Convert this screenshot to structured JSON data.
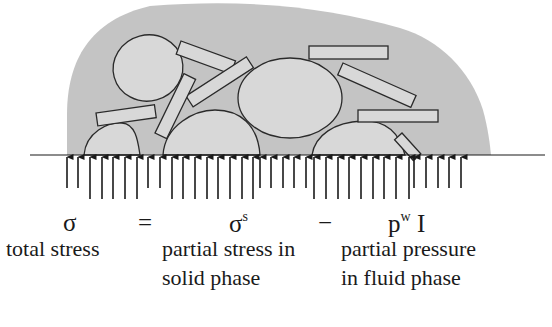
{
  "diagram": {
    "colors": {
      "fluid_fill": "#c4c4c4",
      "particle_fill": "#d8d8d8",
      "outline": "#2a2a2a",
      "arrow": "#1a1a1a"
    },
    "elements": {
      "fluid_region": "grey soil matrix (fluid phase)",
      "particles": "ellipse and rectangular solid grains",
      "boundary_line": "horizontal base line",
      "fluid_pressure_arrows": "short upward arrows (fluid pressure)",
      "solid_contact_arrows": "long upward arrows (solid contact stress)"
    }
  },
  "equation": {
    "lhs": "σ",
    "equals": "=",
    "term1_base": "σ",
    "term1_sup": "s",
    "minus": "−",
    "term2_base": "p",
    "term2_sup": "w",
    "term2_tail": " I"
  },
  "labels": {
    "total_stress": "total stress",
    "partial_stress_line1": "partial stress in",
    "partial_stress_line2": "solid phase",
    "partial_pressure_line1": "partial pressure",
    "partial_pressure_line2": "in fluid phase"
  }
}
